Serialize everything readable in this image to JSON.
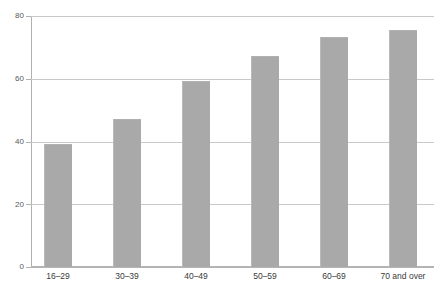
{
  "chart_data": {
    "type": "bar",
    "title": "",
    "xlabel": "",
    "ylabel": "",
    "categories": [
      "16–29",
      "30–39",
      "40–49",
      "50–59",
      "60–69",
      "70 and over"
    ],
    "values": [
      39.3,
      47.3,
      59.4,
      67.4,
      73.2,
      75.4
    ],
    "ylim": [
      0,
      80
    ],
    "yticks": [
      0,
      20,
      40,
      60,
      80
    ],
    "ytick_labels": [
      "0",
      "20",
      "40",
      "60",
      "80"
    ],
    "grid": true,
    "legend": false,
    "legend_position": "none",
    "series": [
      {
        "name": "",
        "values": [
          39.3,
          47.3,
          59.4,
          67.4,
          73.2,
          75.4
        ]
      }
    ]
  },
  "style": {
    "bar_color": "#a9a9a9",
    "gridline_color": "#c9c9c9",
    "axis_color": "#b4b4b4",
    "tick_label_color": "#58585a",
    "category_label_color": "#3a3a3c",
    "background": "#ffffff"
  },
  "clipped_title_fragment": ""
}
